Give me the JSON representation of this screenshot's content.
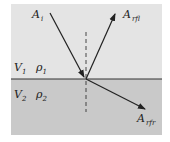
{
  "diagram": {
    "labels": {
      "incident": "A",
      "incident_sub": "i",
      "reflected": "A",
      "reflected_sub": "rfl",
      "refracted": "A",
      "refracted_sub": "rfr",
      "v1": "V",
      "v1_sub": "1",
      "rho1": "ρ",
      "rho1_sub": "1",
      "v2": "V",
      "v2_sub": "2",
      "rho2": "ρ",
      "rho2_sub": "2"
    },
    "colors": {
      "upper_medium": "#e4e4e4",
      "lower_medium": "#c9c9c9",
      "lines": "#222222"
    }
  }
}
